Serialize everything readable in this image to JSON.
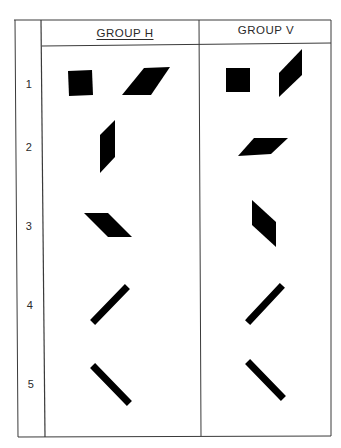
{
  "table": {
    "columns": [
      {
        "id": "group-h",
        "label": "GROUP H"
      },
      {
        "id": "group-v",
        "label": "GROUP V"
      }
    ],
    "rows": [
      {
        "number": "1"
      },
      {
        "number": "2"
      },
      {
        "number": "3"
      },
      {
        "number": "4"
      },
      {
        "number": "5"
      }
    ]
  },
  "colors": {
    "ink": "#000000",
    "line": "#3a3a3a",
    "background": "#ffffff"
  },
  "shapes": {
    "row1": {
      "group_h": [
        "square",
        "parallelogram-wide-slanted-right"
      ],
      "group_v": [
        "square",
        "parallelogram-tall-slanted-right"
      ]
    },
    "row2": {
      "group_h": [
        "parallelogram-tall-slanted-right"
      ],
      "group_v": [
        "parallelogram-wide-slanted-right"
      ]
    },
    "row3": {
      "group_h": [
        "parallelogram-wide-slanted-left"
      ],
      "group_v": [
        "parallelogram-tall-slanted-left"
      ]
    },
    "row4": {
      "group_h": [
        "bar-ascending"
      ],
      "group_v": [
        "bar-ascending"
      ]
    },
    "row5": {
      "group_h": [
        "bar-descending"
      ],
      "group_v": [
        "bar-descending"
      ]
    }
  }
}
